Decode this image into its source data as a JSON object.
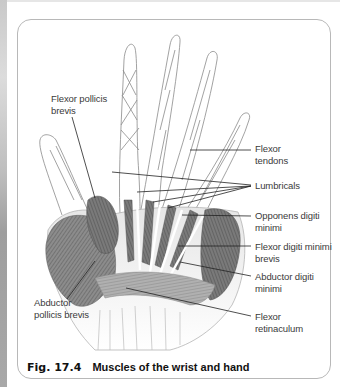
{
  "figure": {
    "number": "Fig. 17.4",
    "title": "Muscles of the wrist and hand"
  },
  "labels": {
    "flexor_pollicis_brevis": [
      "Flexor pollicis",
      "brevis"
    ],
    "flexor_tendons": [
      "Flexor",
      "tendons"
    ],
    "lumbricals": [
      "Lumbricals"
    ],
    "opponens_digiti_minimi": [
      "Opponens digiti",
      "minimi"
    ],
    "flexor_digiti_minimi_brevis": [
      "Flexor digiti minimi",
      "brevis"
    ],
    "abductor_digiti_minimi": [
      "Abductor digiti",
      "minimi"
    ],
    "abductor_pollicis_brevis": [
      "Abductor",
      "pollicis brevis"
    ],
    "flexor_retinaculum": [
      "Flexor",
      "retinaculum"
    ]
  },
  "colors": {
    "muscle_dark": "#6e6e6e",
    "muscle_mid": "#9a9a9a",
    "outline": "#8a8a8a",
    "leader_line": "#222222",
    "frame_border": "#b8b8b8"
  }
}
